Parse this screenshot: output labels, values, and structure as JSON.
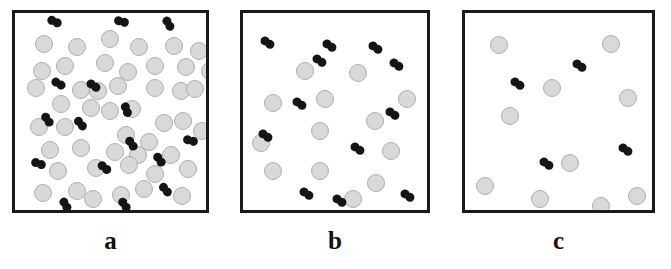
{
  "figure": {
    "kind": "scientific-schematic",
    "width": 671,
    "height": 269,
    "background_color": "#ffffff",
    "solvent_color": "#d9d9d9",
    "solvent_outline_color": "#aeaeae",
    "dimer_color": "#151515",
    "border_color": "#1a1a1a",
    "label_color": "#111111"
  },
  "panels": [
    {
      "id": "panel-a",
      "label": "a",
      "box": {
        "x": 12,
        "y": 10,
        "width": 197,
        "height": 203
      },
      "label_box": {
        "x": 12,
        "y": 228,
        "width": 197
      },
      "solvent_count": 47,
      "dimer_count": 16,
      "solvent_radius": 9,
      "dimer_bead_radius": 4.5,
      "solvents": [
        {
          "cx": 41,
          "cy": 41
        },
        {
          "cx": 74,
          "cy": 44
        },
        {
          "cx": 107,
          "cy": 36
        },
        {
          "cx": 136,
          "cy": 44
        },
        {
          "cx": 171,
          "cy": 43
        },
        {
          "cx": 196,
          "cy": 48
        },
        {
          "cx": 39,
          "cy": 68
        },
        {
          "cx": 62,
          "cy": 63
        },
        {
          "cx": 102,
          "cy": 60
        },
        {
          "cx": 125,
          "cy": 69
        },
        {
          "cx": 152,
          "cy": 63
        },
        {
          "cx": 183,
          "cy": 64
        },
        {
          "cx": 207,
          "cy": 68
        },
        {
          "cx": 33,
          "cy": 85
        },
        {
          "cx": 78,
          "cy": 87
        },
        {
          "cx": 95,
          "cy": 88
        },
        {
          "cx": 115,
          "cy": 83
        },
        {
          "cx": 152,
          "cy": 85
        },
        {
          "cx": 178,
          "cy": 88
        },
        {
          "cx": 192,
          "cy": 86
        },
        {
          "cx": 58,
          "cy": 101
        },
        {
          "cx": 88,
          "cy": 105
        },
        {
          "cx": 107,
          "cy": 108
        },
        {
          "cx": 129,
          "cy": 106
        },
        {
          "cx": 161,
          "cy": 120
        },
        {
          "cx": 180,
          "cy": 118
        },
        {
          "cx": 36,
          "cy": 124
        },
        {
          "cx": 62,
          "cy": 124
        },
        {
          "cx": 123,
          "cy": 132
        },
        {
          "cx": 146,
          "cy": 139
        },
        {
          "cx": 199,
          "cy": 128
        },
        {
          "cx": 47,
          "cy": 147
        },
        {
          "cx": 78,
          "cy": 145
        },
        {
          "cx": 112,
          "cy": 149
        },
        {
          "cx": 135,
          "cy": 152
        },
        {
          "cx": 168,
          "cy": 152
        },
        {
          "cx": 55,
          "cy": 168
        },
        {
          "cx": 93,
          "cy": 165
        },
        {
          "cx": 126,
          "cy": 162
        },
        {
          "cx": 152,
          "cy": 171
        },
        {
          "cx": 185,
          "cy": 166
        },
        {
          "cx": 40,
          "cy": 190
        },
        {
          "cx": 74,
          "cy": 188
        },
        {
          "cx": 90,
          "cy": 196
        },
        {
          "cx": 118,
          "cy": 192
        },
        {
          "cx": 141,
          "cy": 186
        },
        {
          "cx": 179,
          "cy": 193
        }
      ],
      "dimers": [
        {
          "cx": 51,
          "cy": 18,
          "angle": 25
        },
        {
          "cx": 118,
          "cy": 18,
          "angle": 15
        },
        {
          "cx": 165,
          "cy": 20,
          "angle": 60
        },
        {
          "cx": 55,
          "cy": 80,
          "angle": 30
        },
        {
          "cx": 90,
          "cy": 82,
          "angle": 35
        },
        {
          "cx": 123,
          "cy": 106,
          "angle": 70
        },
        {
          "cx": 44,
          "cy": 116,
          "angle": 55
        },
        {
          "cx": 77,
          "cy": 120,
          "angle": 50
        },
        {
          "cx": 128,
          "cy": 140,
          "angle": 55
        },
        {
          "cx": 187,
          "cy": 137,
          "angle": 15
        },
        {
          "cx": 35,
          "cy": 160,
          "angle": 20
        },
        {
          "cx": 101,
          "cy": 164,
          "angle": 40
        },
        {
          "cx": 156,
          "cy": 156,
          "angle": 55
        },
        {
          "cx": 162,
          "cy": 186,
          "angle": 50
        },
        {
          "cx": 62,
          "cy": 201,
          "angle": 60
        },
        {
          "cx": 121,
          "cy": 201,
          "angle": 55
        }
      ]
    },
    {
      "id": "panel-b",
      "label": "b",
      "box": {
        "x": 240,
        "y": 10,
        "width": 190,
        "height": 203
      },
      "label_box": {
        "x": 240,
        "y": 228,
        "width": 190
      },
      "solvent_count": 13,
      "dimer_count": 12,
      "solvent_radius": 9,
      "dimer_bead_radius": 4.5,
      "solvents": [
        {
          "cx": 302,
          "cy": 68
        },
        {
          "cx": 355,
          "cy": 70
        },
        {
          "cx": 322,
          "cy": 96
        },
        {
          "cx": 270,
          "cy": 100
        },
        {
          "cx": 372,
          "cy": 118
        },
        {
          "cx": 317,
          "cy": 128
        },
        {
          "cx": 388,
          "cy": 148
        },
        {
          "cx": 270,
          "cy": 168
        },
        {
          "cx": 317,
          "cy": 168
        },
        {
          "cx": 373,
          "cy": 180
        },
        {
          "cx": 258,
          "cy": 140
        },
        {
          "cx": 404,
          "cy": 96
        },
        {
          "cx": 350,
          "cy": 196
        }
      ],
      "dimers": [
        {
          "cx": 264,
          "cy": 39
        },
        {
          "cx": 326,
          "cy": 42
        },
        {
          "cx": 316,
          "cy": 57
        },
        {
          "cx": 372,
          "cy": 44
        },
        {
          "cx": 393,
          "cy": 61
        },
        {
          "cx": 296,
          "cy": 100
        },
        {
          "cx": 389,
          "cy": 110
        },
        {
          "cx": 262,
          "cy": 132
        },
        {
          "cx": 354,
          "cy": 145
        },
        {
          "cx": 303,
          "cy": 190
        },
        {
          "cx": 404,
          "cy": 192
        },
        {
          "cx": 336,
          "cy": 197
        }
      ]
    },
    {
      "id": "panel-c",
      "label": "c",
      "box": {
        "x": 462,
        "y": 10,
        "width": 193,
        "height": 203
      },
      "label_box": {
        "x": 462,
        "y": 228,
        "width": 193
      },
      "solvent_count": 10,
      "dimer_count": 4,
      "solvent_radius": 9,
      "dimer_bead_radius": 4.5,
      "solvents": [
        {
          "cx": 496,
          "cy": 42
        },
        {
          "cx": 608,
          "cy": 41
        },
        {
          "cx": 549,
          "cy": 85
        },
        {
          "cx": 625,
          "cy": 95
        },
        {
          "cx": 507,
          "cy": 113
        },
        {
          "cx": 567,
          "cy": 160
        },
        {
          "cx": 482,
          "cy": 183
        },
        {
          "cx": 537,
          "cy": 196
        },
        {
          "cx": 598,
          "cy": 203
        },
        {
          "cx": 634,
          "cy": 193
        }
      ],
      "dimers": [
        {
          "cx": 576,
          "cy": 62
        },
        {
          "cx": 514,
          "cy": 80
        },
        {
          "cx": 622,
          "cy": 146
        },
        {
          "cx": 543,
          "cy": 160
        }
      ]
    }
  ]
}
